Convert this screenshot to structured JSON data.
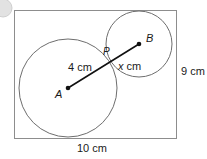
{
  "figure": {
    "type": "geometry-diagram",
    "canvas": {
      "width": 207,
      "height": 159,
      "background": "#ffffff"
    },
    "colors": {
      "outline": "#8a8a8a",
      "circle_stroke": "#6e6e6e",
      "segment": "#111111",
      "text": "#1a1a1a",
      "corner_mark": "#d4d4d4"
    },
    "rectangle": {
      "name": "bounding-rectangle",
      "x": 14,
      "y": 10,
      "width": 163,
      "height": 129,
      "width_label": "10 cm",
      "height_label": "9 cm"
    },
    "circles": [
      {
        "name": "large-circle",
        "center_label": "A",
        "cx": 68,
        "cy": 88,
        "r": 49
      },
      {
        "name": "small-circle",
        "center_label": "B",
        "cx": 139,
        "cy": 44,
        "r": 33
      }
    ],
    "points": [
      {
        "name": "point-a",
        "label": "A",
        "x": 68,
        "y": 88,
        "dot": true
      },
      {
        "name": "point-b",
        "label": "B",
        "x": 139,
        "y": 44,
        "dot": true
      },
      {
        "name": "point-p",
        "label": "P",
        "x": 113,
        "y": 62,
        "dot": false
      }
    ],
    "segment": {
      "name": "segment-ab",
      "from": "A",
      "to": "B",
      "x1": 68,
      "y1": 88,
      "x2": 139,
      "y2": 44,
      "sub_segments": [
        {
          "name": "segment-ap",
          "label": "4 cm",
          "from": "A",
          "to": "P"
        },
        {
          "name": "segment-pb",
          "label_prefix": "x",
          "label_suffix": " cm",
          "from": "P",
          "to": "B"
        }
      ]
    },
    "labels": {
      "point_a": "A",
      "point_b": "B",
      "point_p": "P",
      "segment_ap": "4 cm",
      "segment_pb_var": "x",
      "segment_pb_unit": " cm",
      "rect_height": "9 cm",
      "rect_width": "10 cm"
    }
  }
}
